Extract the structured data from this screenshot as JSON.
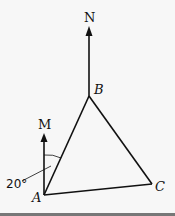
{
  "diagram": {
    "type": "bearing-triangle",
    "points": {
      "A": {
        "label": "A",
        "x": 44,
        "y": 195
      },
      "B": {
        "label": "B",
        "x": 89,
        "y": 96
      },
      "C": {
        "label": "C",
        "x": 152,
        "y": 184
      }
    },
    "north_arrows": [
      {
        "label": "N",
        "from": "B",
        "tip_y": 26
      },
      {
        "label": "M",
        "from": "A",
        "tip_y": 133
      }
    ],
    "angle": {
      "label": "20°",
      "between": [
        "AM",
        "AB"
      ]
    },
    "colors": {
      "line": "#111111",
      "background": "#f7f7f7",
      "footer_bar": "#777777"
    }
  }
}
